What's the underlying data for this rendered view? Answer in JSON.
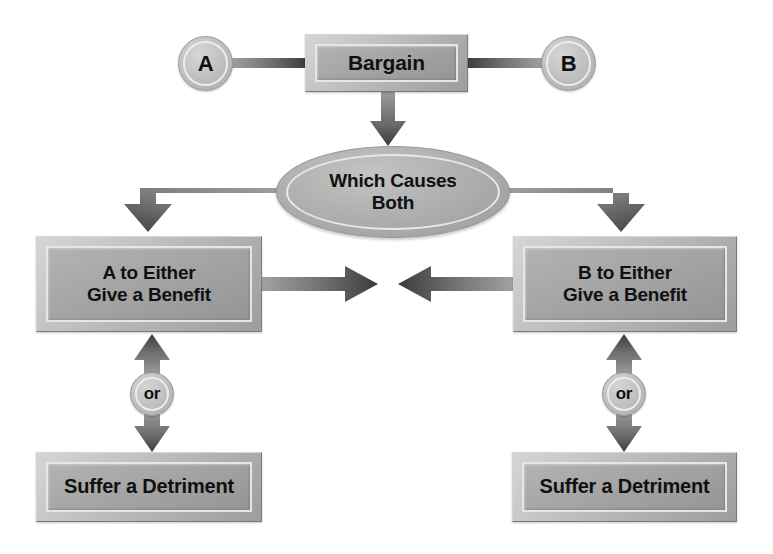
{
  "diagram": {
    "background_color": "#ffffff",
    "node_fill": "#a5a5a5",
    "node_bevel": "#c8c8c8",
    "text_color": "#101010",
    "connector_color": "#6f6f6f"
  },
  "nodes": {
    "party_a": {
      "label": "A",
      "shape": "circle"
    },
    "party_b": {
      "label": "B",
      "shape": "circle"
    },
    "bargain": {
      "label": "Bargain",
      "shape": "rectangle"
    },
    "which_causes_both": {
      "label": "Which Causes\nBoth",
      "shape": "ellipse"
    },
    "a_benefit": {
      "label": "A to Either\nGive a Benefit",
      "shape": "rectangle"
    },
    "b_benefit": {
      "label": "B to Either\nGive a Benefit",
      "shape": "rectangle"
    },
    "or_left": {
      "label": "or",
      "shape": "circle"
    },
    "or_right": {
      "label": "or",
      "shape": "circle"
    },
    "a_detriment": {
      "label": "Suffer a Detriment",
      "shape": "rectangle"
    },
    "b_detriment": {
      "label": "Suffer a Detriment",
      "shape": "rectangle"
    }
  },
  "connectors": [
    {
      "name": "a-to-bargain",
      "from": "party_a",
      "to": "bargain",
      "style": "line"
    },
    {
      "name": "bargain-to-b",
      "from": "bargain",
      "to": "party_b",
      "style": "line"
    },
    {
      "name": "bargain-to-ellipse",
      "from": "bargain",
      "to": "which_causes_both",
      "style": "arrow-down"
    },
    {
      "name": "ellipse-to-a-benefit",
      "from": "which_causes_both",
      "to": "a_benefit",
      "style": "elbow-arrow-down-left"
    },
    {
      "name": "ellipse-to-b-benefit",
      "from": "which_causes_both",
      "to": "b_benefit",
      "style": "elbow-arrow-down-right"
    },
    {
      "name": "a-benefit-to-center",
      "from": "a_benefit",
      "to": "center",
      "style": "arrow-right"
    },
    {
      "name": "b-benefit-to-center",
      "from": "b_benefit",
      "to": "center",
      "style": "arrow-left"
    },
    {
      "name": "a-benefit-or-detriment",
      "from": "a_benefit",
      "to": "a_detriment",
      "style": "double-arrow-vertical"
    },
    {
      "name": "b-benefit-or-detriment",
      "from": "b_benefit",
      "to": "b_detriment",
      "style": "double-arrow-vertical"
    }
  ]
}
